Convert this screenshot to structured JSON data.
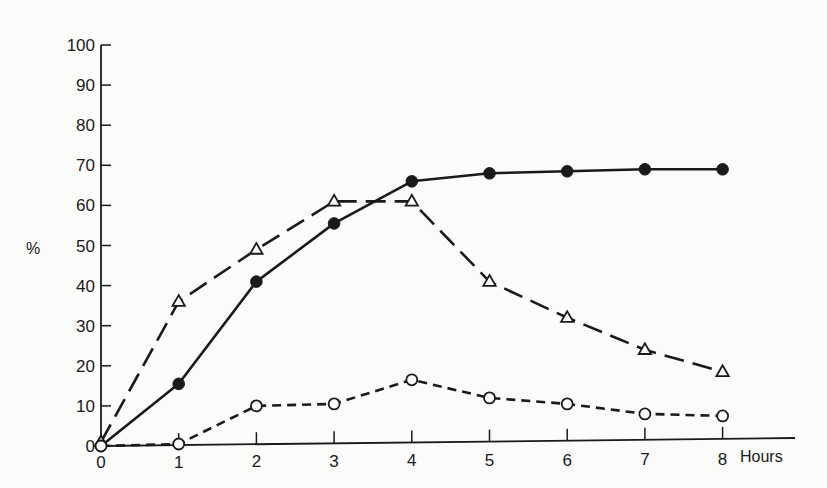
{
  "chart_data": {
    "type": "line",
    "title": "",
    "xlabel": "Hours",
    "ylabel": "%",
    "x": [
      0,
      1,
      2,
      3,
      4,
      5,
      6,
      7,
      8
    ],
    "x_tick_labels": [
      "0",
      "1",
      "2",
      "3",
      "4",
      "5",
      "6",
      "7",
      "8"
    ],
    "y_tick_labels": [
      "0",
      "10",
      "20",
      "30",
      "40",
      "50",
      "60",
      "70",
      "80",
      "90",
      "100"
    ],
    "xlim": [
      0,
      8
    ],
    "ylim": [
      0,
      100
    ],
    "grid": false,
    "legend": null,
    "series": [
      {
        "name": "filled circles (solid line)",
        "marker": "filled-circle",
        "line_style": "solid",
        "values": [
          0,
          15.5,
          41,
          55.5,
          66,
          68,
          68.5,
          69,
          69
        ]
      },
      {
        "name": "open triangles (long-dash line)",
        "marker": "open-triangle",
        "line_style": "long-dash",
        "values": [
          1,
          36,
          49,
          61,
          61,
          41,
          32,
          24,
          18.5
        ]
      },
      {
        "name": "open circles (short-dash line)",
        "marker": "open-circle",
        "line_style": "short-dash",
        "values": [
          0,
          0.5,
          10,
          10.5,
          16.5,
          12,
          10.5,
          8,
          7.5
        ]
      }
    ],
    "colors": {
      "ink": "#1a1a1a",
      "paper": "#fbfbf9"
    }
  }
}
